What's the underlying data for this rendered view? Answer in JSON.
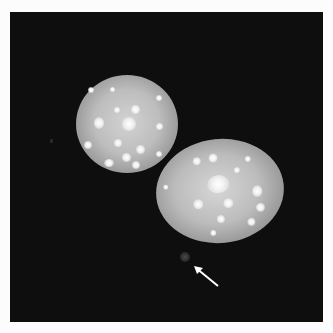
{
  "figure": {
    "type": "fluorescence micrograph",
    "background_color": "#0e0e0e",
    "margin_color": "#fcfcfc",
    "nuclei": [
      {
        "label": "nucleus-upper-left",
        "center": [
          127,
          123
        ],
        "size": [
          102,
          98
        ]
      },
      {
        "label": "nucleus-lower-right",
        "center": [
          220,
          191
        ],
        "size": [
          128,
          104
        ]
      }
    ],
    "annotations": {
      "arrow": {
        "direction": "pointing up-left",
        "color": "#ffffff",
        "target": "small faint body below nuclei"
      }
    }
  }
}
